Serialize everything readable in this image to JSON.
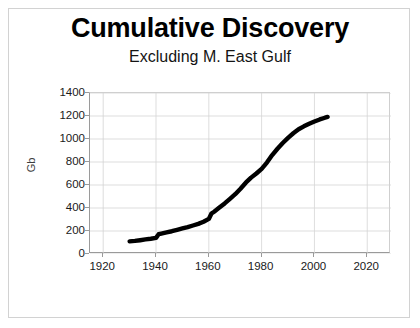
{
  "chart_data": {
    "type": "line",
    "title": "Cumulative Discovery",
    "subtitle": "Excluding M. East Gulf",
    "xlabel": "",
    "ylabel": "Gb",
    "xlim": [
      1915,
      2029
    ],
    "ylim": [
      0,
      1400
    ],
    "xticks": [
      1920,
      1940,
      1960,
      1980,
      2000,
      2020
    ],
    "yticks": [
      0,
      200,
      400,
      600,
      800,
      1000,
      1200,
      1400
    ],
    "grid": true,
    "legend": false,
    "series": [
      {
        "name": "Cumulative Discovery",
        "color": "#000000",
        "x": [
          1930,
          1932,
          1934,
          1936,
          1938,
          1940,
          1941,
          1942,
          1944,
          1946,
          1948,
          1950,
          1952,
          1954,
          1956,
          1958,
          1960,
          1961,
          1962,
          1964,
          1966,
          1968,
          1970,
          1972,
          1974,
          1976,
          1978,
          1980,
          1982,
          1984,
          1986,
          1988,
          1990,
          1992,
          1994,
          1996,
          1998,
          2000,
          2002,
          2004,
          2005
        ],
        "values": [
          110,
          114,
          120,
          127,
          133,
          140,
          172,
          178,
          188,
          198,
          210,
          222,
          234,
          248,
          262,
          280,
          305,
          352,
          368,
          404,
          440,
          480,
          520,
          568,
          620,
          664,
          700,
          740,
          795,
          860,
          915,
          965,
          1010,
          1050,
          1085,
          1110,
          1132,
          1152,
          1170,
          1185,
          1192
        ]
      }
    ]
  }
}
